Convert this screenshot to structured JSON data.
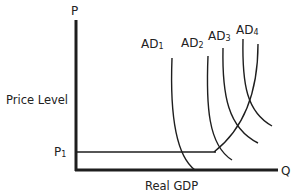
{
  "diagram": {
    "title": "",
    "y_axis": {
      "symbol": "P",
      "label": "Price Level",
      "tick_label": "P",
      "tick_sub": "1"
    },
    "x_axis": {
      "symbol": "Q",
      "label": "Real GDP"
    },
    "curves": [
      {
        "name": "AD",
        "sub": "1"
      },
      {
        "name": "AD",
        "sub": "2"
      },
      {
        "name": "AD",
        "sub": "3"
      },
      {
        "name": "AD",
        "sub": "4"
      }
    ],
    "colors": {
      "line": "#1e1e1e",
      "text": "#222222",
      "background": "#ffffff"
    }
  }
}
